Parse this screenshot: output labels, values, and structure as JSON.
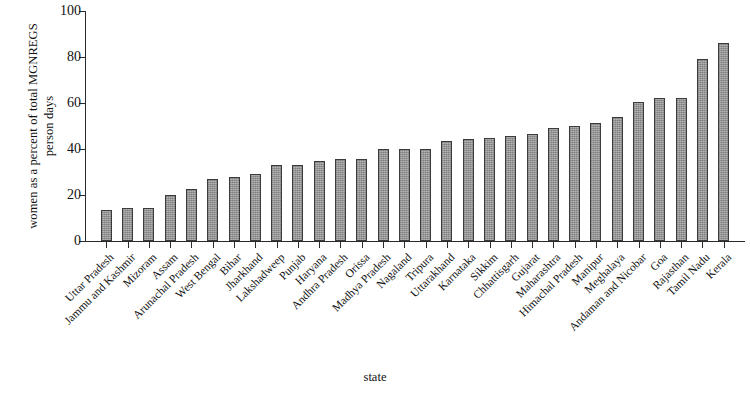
{
  "chart_data": {
    "type": "bar",
    "title": "",
    "xlabel": "state",
    "ylabel": "women as a percent of total MGNREGS person days",
    "ylim": [
      0,
      100
    ],
    "yticks": [
      0,
      20,
      40,
      60,
      80,
      100
    ],
    "grid": false,
    "legend": null,
    "bar_color": "#8e8e8e",
    "bar_edge_color": "#3b3b3b",
    "categories": [
      "Uttar Pradesh",
      "Jammu and Kashmir",
      "Mizoram",
      "Assam",
      "Arunachal Pradesh",
      "West Bengal",
      "Bihar",
      "Jharkhand",
      "Lakshadweep",
      "Punjab",
      "Haryana",
      "Andhra Pradesh",
      "Orissa",
      "Madhya Pradesh",
      "Nagaland",
      "Tripura",
      "Uttarakhand",
      "Karnataka",
      "Sikkim",
      "Chhattisgarh",
      "Gujarat",
      "Maharashtra",
      "Himachal Pradesh",
      "Manipur",
      "Meghalaya",
      "Andaman and Nicobar",
      "Goa",
      "Rajasthan",
      "Tamil Nadu",
      "Kerala"
    ],
    "values": [
      13.5,
      14.5,
      14.5,
      20,
      22.5,
      27,
      28,
      29,
      33,
      33,
      35,
      35.5,
      35.5,
      40,
      40,
      40,
      43.5,
      44.5,
      45,
      45.5,
      46.5,
      49,
      50,
      51.5,
      54,
      60.5,
      62,
      62,
      79,
      86
    ]
  }
}
